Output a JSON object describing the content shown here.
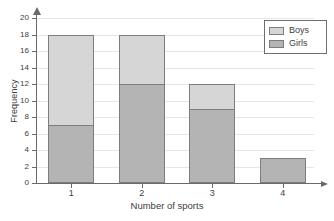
{
  "chart_data": {
    "type": "bar",
    "subtype": "stacked-bar",
    "title": "",
    "xlabel": "Number of sports",
    "ylabel": "Frequency",
    "categories": [
      "1",
      "2",
      "3",
      "4"
    ],
    "series": [
      {
        "name": "Girls",
        "values": [
          7,
          12,
          9,
          3
        ],
        "color": "#b4b4b4"
      },
      {
        "name": "Boys",
        "values": [
          11,
          6,
          3,
          0
        ],
        "color": "#d6d6d6"
      }
    ],
    "totals": [
      18,
      18,
      12,
      3
    ],
    "ylim": [
      0,
      20
    ],
    "ytick_step": 2,
    "yticks": [
      0,
      2,
      4,
      6,
      8,
      10,
      12,
      14,
      16,
      18,
      20
    ],
    "ytick_labels": [
      "0",
      "2",
      "4",
      "6",
      "8",
      "10",
      "12",
      "14",
      "16",
      "18",
      "20"
    ],
    "grid": true,
    "grid_axis": "y",
    "legend_position": "top-right",
    "legend_entries": [
      "Boys",
      "Girls"
    ],
    "axis_arrows": true
  },
  "axes": {
    "y_title": "Frequency",
    "x_title": "Number of sports"
  },
  "legend": {
    "items": [
      {
        "label": "Boys"
      },
      {
        "label": "Girls"
      }
    ]
  },
  "colors": {
    "boys": "#d6d6d6",
    "girls": "#b4b4b4",
    "axis": "#6a6a6a",
    "grid": "#e6e6e6",
    "bar_border": "#7d7d7d",
    "text": "#3d3d3d",
    "background": "#ffffff"
  }
}
